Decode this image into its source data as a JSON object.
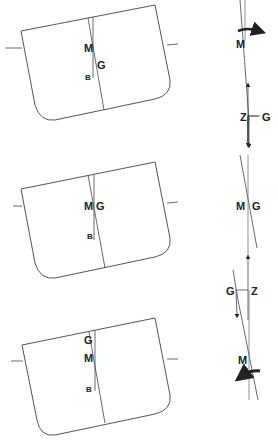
{
  "diagram": {
    "colors": {
      "line": "#444444",
      "hull": "#555555",
      "text": "#222222",
      "background": "#ffffff"
    },
    "rows": [
      {
        "id": "positive-stability",
        "ship_labels": {
          "M": "M",
          "G": "G",
          "B": "B"
        },
        "force_labels": {
          "M": "M",
          "Z": "Z",
          "G": "G"
        },
        "moment": "righting (arrow at M curving right)"
      },
      {
        "id": "neutral-stability",
        "ship_labels": {
          "M": "M",
          "G": "G",
          "B": "B"
        },
        "force_labels": {
          "M": "M",
          "G": "G"
        },
        "moment": "none (M and G coincide)"
      },
      {
        "id": "negative-stability",
        "ship_labels": {
          "G": "G",
          "M": "M",
          "B": "B"
        },
        "force_labels": {
          "G": "G",
          "Z": "Z",
          "M": "M"
        },
        "moment": "capsizing (arrow at M curving left)"
      }
    ]
  }
}
